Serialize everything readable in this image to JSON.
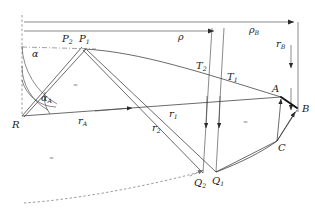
{
  "figure": {
    "background_color": "#ffffff",
    "line_color": "#2b2b2b",
    "dashed_color": "#6e6e6e",
    "highlight_color": "#111111"
  },
  "labels": {
    "R": {
      "text": "R",
      "sub": ""
    },
    "P1": {
      "text": "P",
      "sub": "1"
    },
    "P2": {
      "text": "P",
      "sub": "2"
    },
    "Q1": {
      "text": "Q",
      "sub": "1"
    },
    "Q2": {
      "text": "Q",
      "sub": "2"
    },
    "T1": {
      "text": "T",
      "sub": "1"
    },
    "T2": {
      "text": "T",
      "sub": "2"
    },
    "A": {
      "text": "A",
      "sub": ""
    },
    "B": {
      "text": "B",
      "sub": ""
    },
    "C": {
      "text": "C",
      "sub": ""
    },
    "alpha": {
      "text": "α",
      "sub": ""
    },
    "alpha_A": {
      "text": "α",
      "sub": "A"
    },
    "rho": {
      "text": "ρ",
      "sub": ""
    },
    "rho_B": {
      "text": "ρ",
      "sub": "B"
    },
    "r_A": {
      "text": "r",
      "sub": "A"
    },
    "r_B": {
      "text": "r",
      "sub": "B"
    },
    "r_1": {
      "text": "r",
      "sub": "1"
    },
    "r_2": {
      "text": "r",
      "sub": "2"
    }
  },
  "hatch_marks": [
    {
      "id": "hatch-upper-left",
      "glyph": "≈"
    },
    {
      "id": "hatch-lower-left",
      "glyph": "≈"
    },
    {
      "id": "hatch-right",
      "glyph": "≈"
    }
  ],
  "geometry": {
    "points": {
      "R": [
        22,
        116
      ],
      "P": [
        83,
        49
      ],
      "A": [
        280,
        97
      ],
      "B": [
        298,
        108
      ],
      "C": [
        277,
        140
      ],
      "Q1": [
        216,
        172
      ],
      "Q2": [
        203,
        173
      ],
      "T1": [
        226,
        83
      ],
      "T2": [
        203,
        71
      ]
    },
    "top_arrow_rho_end": [
      218,
      31
    ],
    "top_arrow_rhoB_end": [
      298,
      22
    ],
    "vertical_dashed_x": 22
  }
}
